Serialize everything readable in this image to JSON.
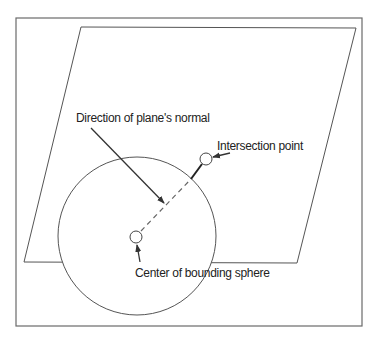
{
  "diagram": {
    "type": "geometry-illustration",
    "colors": {
      "line": "#5a5a5a",
      "text": "#222222",
      "background": "#ffffff"
    },
    "frame": {
      "x": 16,
      "y": 18,
      "width": 346,
      "height": 308
    },
    "plane": {
      "shape": "parallelogram",
      "points": [
        [
          81,
          27
        ],
        [
          356,
          28
        ],
        [
          297,
          263
        ],
        [
          24,
          262
        ]
      ]
    },
    "sphere": {
      "cx": 137,
      "cy": 236,
      "r": 79
    },
    "center_point": {
      "cx": 136,
      "cy": 237,
      "r": 6
    },
    "intersection_point": {
      "cx": 206,
      "cy": 159,
      "r": 6
    },
    "labels": {
      "normal": "Direction of plane's normal",
      "intersection": "Intersection point",
      "center": "Center of bounding sphere"
    }
  }
}
